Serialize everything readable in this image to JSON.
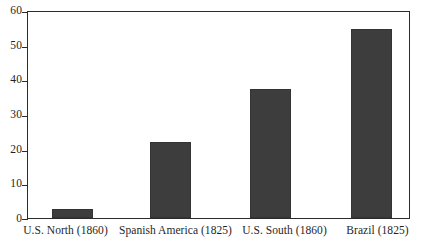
{
  "chart_data": {
    "type": "bar",
    "title": "",
    "subtitle": "",
    "xlabel": "",
    "ylabel": "",
    "categories": [
      "U.S. North (1860)",
      "Spanish America (1825)",
      "U.S. South (1860)",
      "Brazil (1825)"
    ],
    "values": [
      2.5,
      22,
      37.5,
      55
    ],
    "ylim": [
      0,
      60
    ],
    "y_ticks": [
      0,
      10,
      20,
      30,
      40,
      50,
      60
    ],
    "y_tick_labels": [
      "0",
      "10",
      "20",
      "30",
      "40",
      "50",
      "60"
    ],
    "grid": false,
    "legend": false,
    "legend_position": "none",
    "bar_color": "#3d3d3d",
    "axis_color": "#2b2b2b",
    "background_color": "#ffffff"
  }
}
